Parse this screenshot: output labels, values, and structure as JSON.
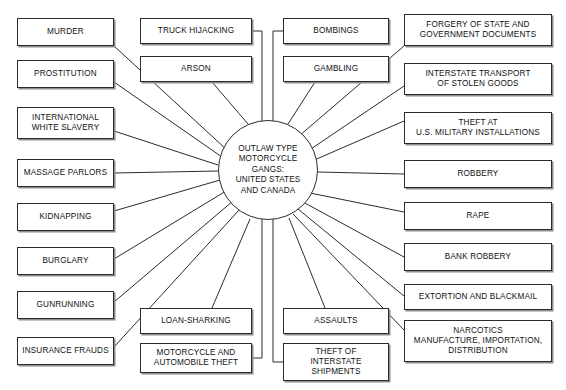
{
  "diagram": {
    "type": "hub-and-spoke",
    "title": "OUTLAW TYPE MOTORCYCLE GANGS: UNITED STATES AND CANADA",
    "center": {
      "id": "center",
      "label": "OUTLAW TYPE\nMOTORCYCLE\nGANGS:\nUNITED STATES\nAND CANADA",
      "cx": 268,
      "cy": 170,
      "r": 50
    },
    "colors": {
      "background": "#ffffff",
      "box_border": "#2b2b2b",
      "box_shadow": "#8d8d8d",
      "edge_line": "#2b2b2b",
      "text": "#111111"
    },
    "nodes": [
      {
        "id": "murder",
        "name": "murder",
        "label": "MURDER",
        "x": 17,
        "y": 18,
        "w": 97,
        "h": 28,
        "group": "left"
      },
      {
        "id": "prostitution",
        "name": "prostitution",
        "label": "PROSTITUTION",
        "x": 17,
        "y": 60,
        "w": 97,
        "h": 28,
        "group": "left"
      },
      {
        "id": "white-slavery",
        "name": "white-slavery",
        "label": "INTERNATIONAL\nWHITE SLAVERY",
        "x": 17,
        "y": 107,
        "w": 97,
        "h": 32,
        "group": "left"
      },
      {
        "id": "massage",
        "name": "massage",
        "label": "MASSAGE PARLORS",
        "x": 17,
        "y": 159,
        "w": 97,
        "h": 28,
        "group": "left"
      },
      {
        "id": "kidnapping",
        "name": "kidnapping",
        "label": "KIDNAPPING",
        "x": 17,
        "y": 203,
        "w": 97,
        "h": 28,
        "group": "left"
      },
      {
        "id": "burglary",
        "name": "burglary",
        "label": "BURGLARY",
        "x": 17,
        "y": 247,
        "w": 97,
        "h": 28,
        "group": "left"
      },
      {
        "id": "gunrunning",
        "name": "gunrunning",
        "label": "GUNRUNNING",
        "x": 17,
        "y": 291,
        "w": 97,
        "h": 28,
        "group": "left"
      },
      {
        "id": "insurance",
        "name": "insurance",
        "label": "INSURANCE FRAUDS",
        "x": 17,
        "y": 337,
        "w": 97,
        "h": 28,
        "group": "left"
      },
      {
        "id": "truck",
        "name": "truck-hijacking",
        "label": "TRUCK HIJACKING",
        "x": 140,
        "y": 18,
        "w": 112,
        "h": 26,
        "group": "top-left"
      },
      {
        "id": "arson",
        "name": "arson",
        "label": "ARSON",
        "x": 140,
        "y": 56,
        "w": 112,
        "h": 26,
        "group": "top-left"
      },
      {
        "id": "bombings",
        "name": "bombings",
        "label": "BOMBINGS",
        "x": 283,
        "y": 18,
        "w": 106,
        "h": 26,
        "group": "top-right"
      },
      {
        "id": "gambling",
        "name": "gambling",
        "label": "GAMBLING",
        "x": 283,
        "y": 56,
        "w": 106,
        "h": 26,
        "group": "top-right"
      },
      {
        "id": "loan",
        "name": "loan-sharking",
        "label": "LOAN-SHARKING",
        "x": 140,
        "y": 308,
        "w": 112,
        "h": 26,
        "group": "bottom-left"
      },
      {
        "id": "moto-theft",
        "name": "motorcycle-auto-theft",
        "label": "MOTORCYCLE AND\nAUTOMOBILE THEFT",
        "x": 140,
        "y": 343,
        "w": 112,
        "h": 30,
        "group": "bottom-left"
      },
      {
        "id": "assaults",
        "name": "assaults",
        "label": "ASSAULTS",
        "x": 283,
        "y": 308,
        "w": 106,
        "h": 26,
        "group": "bottom-right"
      },
      {
        "id": "interstate-ship",
        "name": "theft-interstate-shipments",
        "label": "THEFT OF\nINTERSTATE\nSHIPMENTS",
        "x": 283,
        "y": 343,
        "w": 106,
        "h": 38,
        "group": "bottom-right"
      },
      {
        "id": "forgery",
        "name": "forgery",
        "label": "FORGERY OF STATE AND\nGOVERNMENT DOCUMENTS",
        "x": 404,
        "y": 14,
        "w": 148,
        "h": 32,
        "group": "right"
      },
      {
        "id": "stolen-goods",
        "name": "interstate-stolen-goods",
        "label": "INTERSTATE TRANSPORT\nOF STOLEN GOODS",
        "x": 404,
        "y": 63,
        "w": 148,
        "h": 32,
        "group": "right"
      },
      {
        "id": "military-theft",
        "name": "military-theft",
        "label": "THEFT AT\nU.S. MILITARY INSTALLATIONS",
        "x": 404,
        "y": 112,
        "w": 148,
        "h": 32,
        "group": "right"
      },
      {
        "id": "robbery",
        "name": "robbery",
        "label": "ROBBERY",
        "x": 404,
        "y": 160,
        "w": 148,
        "h": 28,
        "group": "right"
      },
      {
        "id": "rape",
        "name": "rape",
        "label": "RAPE",
        "x": 404,
        "y": 202,
        "w": 148,
        "h": 28,
        "group": "right"
      },
      {
        "id": "bank-robbery",
        "name": "bank-robbery",
        "label": "BANK ROBBERY",
        "x": 404,
        "y": 243,
        "w": 148,
        "h": 28,
        "group": "right"
      },
      {
        "id": "extortion",
        "name": "extortion",
        "label": "EXTORTION AND BLACKMAIL",
        "x": 404,
        "y": 284,
        "w": 148,
        "h": 26,
        "group": "right"
      },
      {
        "id": "narcotics",
        "name": "narcotics",
        "label": "NARCOTICS\nMANUFACTURE, IMPORTATION,\nDISTRIBUTION",
        "x": 404,
        "y": 320,
        "w": 148,
        "h": 42,
        "group": "right"
      }
    ],
    "edges": [
      {
        "from": "murder",
        "to": "center",
        "kind": "line",
        "x1": 114,
        "y1": 46,
        "x2": 227,
        "y2": 150
      },
      {
        "from": "prostitution",
        "to": "center",
        "kind": "line",
        "x1": 114,
        "y1": 82,
        "x2": 222,
        "y2": 157
      },
      {
        "from": "white-slavery",
        "to": "center",
        "kind": "line",
        "x1": 114,
        "y1": 131,
        "x2": 218,
        "y2": 165
      },
      {
        "from": "massage",
        "to": "center",
        "kind": "line",
        "x1": 114,
        "y1": 173,
        "x2": 218,
        "y2": 171
      },
      {
        "from": "kidnapping",
        "to": "center",
        "kind": "line",
        "x1": 114,
        "y1": 211,
        "x2": 220,
        "y2": 180
      },
      {
        "from": "burglary",
        "to": "center",
        "kind": "line",
        "x1": 114,
        "y1": 259,
        "x2": 226,
        "y2": 191
      },
      {
        "from": "gunrunning",
        "to": "center",
        "kind": "line",
        "x1": 114,
        "y1": 302,
        "x2": 233,
        "y2": 201
      },
      {
        "from": "insurance",
        "to": "center",
        "kind": "line",
        "x1": 114,
        "y1": 347,
        "x2": 240,
        "y2": 209
      },
      {
        "from": "arson",
        "to": "center",
        "kind": "line",
        "x1": 212,
        "y1": 82,
        "x2": 248,
        "y2": 124
      },
      {
        "from": "gambling",
        "to": "center",
        "kind": "line",
        "x1": 315,
        "y1": 82,
        "x2": 288,
        "y2": 124
      },
      {
        "from": "loan",
        "to": "center",
        "kind": "line",
        "x1": 212,
        "y1": 308,
        "x2": 250,
        "y2": 219
      },
      {
        "from": "assaults",
        "to": "center",
        "kind": "line",
        "x1": 325,
        "y1": 308,
        "x2": 289,
        "y2": 218
      },
      {
        "from": "truck",
        "to": "center",
        "kind": "bracket",
        "side": "left",
        "bx": 262,
        "y1": 31,
        "y2": 128,
        "ex": 252
      },
      {
        "from": "moto-theft",
        "to": "center",
        "kind": "bracket",
        "side": "left",
        "bx": 262,
        "y1": 358,
        "y2": 214,
        "ex": 252
      },
      {
        "from": "bombings",
        "to": "center",
        "kind": "bracket",
        "side": "right",
        "bx": 273,
        "y1": 31,
        "y2": 125,
        "ex": 283
      },
      {
        "from": "interstate-ship",
        "to": "center",
        "kind": "bracket",
        "side": "right",
        "bx": 273,
        "y1": 362,
        "y2": 213,
        "ex": 283
      },
      {
        "from": "forgery",
        "to": "center",
        "kind": "line",
        "x1": 404,
        "y1": 46,
        "x2": 299,
        "y2": 136
      },
      {
        "from": "stolen-goods",
        "to": "center",
        "kind": "line",
        "x1": 404,
        "y1": 86,
        "x2": 308,
        "y2": 151
      },
      {
        "from": "military-theft",
        "to": "center",
        "kind": "line",
        "x1": 404,
        "y1": 121,
        "x2": 312,
        "y2": 161
      },
      {
        "from": "robbery",
        "to": "center",
        "kind": "line",
        "x1": 404,
        "y1": 174,
        "x2": 318,
        "y2": 172
      },
      {
        "from": "rape",
        "to": "center",
        "kind": "line",
        "x1": 404,
        "y1": 212,
        "x2": 310,
        "y2": 193
      },
      {
        "from": "bank-robbery",
        "to": "center",
        "kind": "line",
        "x1": 404,
        "y1": 257,
        "x2": 303,
        "y2": 202
      },
      {
        "from": "extortion",
        "to": "center",
        "kind": "line",
        "x1": 404,
        "y1": 296,
        "x2": 298,
        "y2": 209
      },
      {
        "from": "narcotics",
        "to": "center",
        "kind": "line",
        "x1": 404,
        "y1": 330,
        "x2": 293,
        "y2": 214
      }
    ]
  }
}
